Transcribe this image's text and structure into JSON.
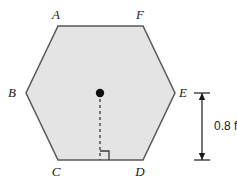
{
  "figure": {
    "shape_name": "regular-hexagon",
    "colors": {
      "fill": "#e4e4e4",
      "stroke": "#58585a",
      "center_dot": "#111111",
      "dashed_line": "#3a3a3a",
      "dimension_line": "#1b1b1b",
      "text": "#1b1b1b",
      "background": "#ffffff"
    },
    "vertices": [
      {
        "id": "A",
        "label": "A",
        "x": 58,
        "y": 26,
        "label_x": 56,
        "label_y": 19
      },
      {
        "id": "F",
        "label": "F",
        "x": 143,
        "y": 26,
        "label_x": 140,
        "label_y": 19
      },
      {
        "id": "E",
        "label": "E",
        "x": 175,
        "y": 93,
        "label_x": 183,
        "label_y": 97
      },
      {
        "id": "D",
        "label": "D",
        "x": 143,
        "y": 160,
        "label_x": 140,
        "label_y": 176
      },
      {
        "id": "C",
        "label": "C",
        "x": 58,
        "y": 160,
        "label_x": 56,
        "label_y": 176
      },
      {
        "id": "B",
        "label": "B",
        "x": 26,
        "y": 93,
        "label_x": 12,
        "label_y": 97
      }
    ],
    "center": {
      "x": 100,
      "y": 93,
      "radius": 4.2
    },
    "apothem": {
      "from_x": 100,
      "from_y": 93,
      "to_x": 100,
      "to_y": 160,
      "dash_pattern": "3,3"
    },
    "right_angle_marker": {
      "x": 103,
      "y": 151,
      "size": 9,
      "present": true
    },
    "dimension": {
      "value_label": "0.8 ft",
      "line_x": 202,
      "top_y": 93,
      "bottom_y": 160,
      "tick_left_x": 194,
      "tick_right_x": 210,
      "label_x": 214,
      "label_y": 130
    }
  }
}
